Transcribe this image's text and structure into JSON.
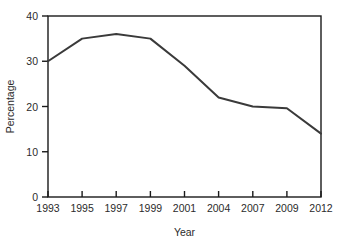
{
  "chart_data": {
    "type": "line",
    "title": "",
    "xlabel": "Year",
    "ylabel": "Percentage",
    "categories": [
      "1993",
      "1995",
      "1997",
      "1999",
      "2001",
      "2004",
      "2007",
      "2009",
      "2012"
    ],
    "x": [
      1993,
      1995,
      1997,
      1999,
      2001,
      2004,
      2007,
      2009,
      2012
    ],
    "values": [
      30,
      35,
      36,
      35,
      29,
      22,
      20,
      19.6,
      14
    ],
    "series": [
      {
        "name": "Percentage",
        "values": [
          30,
          35,
          36,
          35,
          29,
          22,
          20,
          19.6,
          14
        ]
      }
    ],
    "ylim": [
      0,
      40
    ],
    "yticks": [
      0,
      10,
      20,
      30,
      40
    ],
    "yticklabels": [
      "0",
      "10",
      "20",
      "30",
      "40"
    ],
    "xticklabels": [
      "1993",
      "1995",
      "1997",
      "1999",
      "2001",
      "2004",
      "2007",
      "2009",
      "2012"
    ],
    "grid": false,
    "legend": false,
    "legend_position": "none",
    "line_color": "#3a3a3a",
    "line_width": 2,
    "frame_color": "#1a1a1a",
    "background_color": "#ffffff"
  }
}
